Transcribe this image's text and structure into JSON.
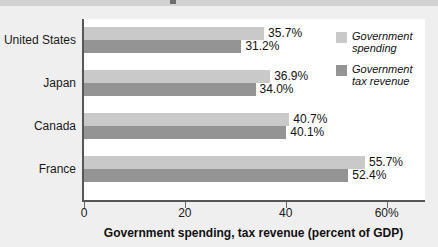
{
  "chart_data": {
    "type": "bar",
    "orientation": "horizontal",
    "title": "",
    "xlabel": "Government spending, tax revenue (percent of GDP)",
    "ylabel": "",
    "categories": [
      "United States",
      "Japan",
      "Canada",
      "France"
    ],
    "series": [
      {
        "name": "Government spending",
        "color": "#c9c9c9",
        "values": [
          35.7,
          36.9,
          40.7,
          55.7
        ],
        "labels": [
          "35.7%",
          "36.9%",
          "40.7%",
          "55.7%"
        ]
      },
      {
        "name": "Government tax revenue",
        "color": "#949494",
        "values": [
          31.2,
          34.0,
          40.1,
          52.4
        ],
        "labels": [
          "31.2%",
          "34.0%",
          "40.1%",
          "52.4%"
        ]
      }
    ],
    "xlim": [
      0,
      68
    ],
    "xticks": [
      0,
      20,
      40,
      60
    ],
    "xticklabels": [
      "0",
      "20",
      "40",
      "60%"
    ],
    "grid": false,
    "legend_position": "top-right"
  },
  "axis": {
    "x_title": "Government spending, tax revenue (percent of GDP)",
    "ticks": [
      {
        "value": 0,
        "label": "0"
      },
      {
        "value": 20,
        "label": "20"
      },
      {
        "value": 40,
        "label": "40"
      },
      {
        "value": 60,
        "label": "60%"
      }
    ]
  },
  "legend": {
    "items": [
      {
        "label_line1": "Government",
        "label_line2": "spending",
        "color": "#c9c9c9"
      },
      {
        "label_line1": "Government",
        "label_line2": "tax revenue",
        "color": "#949494"
      }
    ]
  },
  "groups": [
    {
      "category": "United States",
      "spending_label": "35.7%",
      "spending_value": 35.7,
      "tax_label": "31.2%",
      "tax_value": 31.2
    },
    {
      "category": "Japan",
      "spending_label": "36.9%",
      "spending_value": 36.9,
      "tax_label": "34.0%",
      "tax_value": 34.0
    },
    {
      "category": "Canada",
      "spending_label": "40.7%",
      "spending_value": 40.7,
      "tax_label": "40.1%",
      "tax_value": 40.1
    },
    {
      "category": "France",
      "spending_label": "55.7%",
      "spending_value": 55.7,
      "tax_label": "52.4%",
      "tax_value": 52.4
    }
  ]
}
